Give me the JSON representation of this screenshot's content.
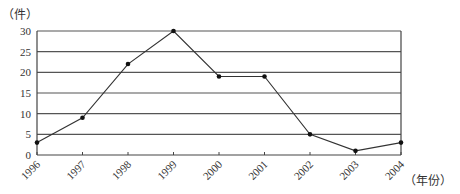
{
  "chart_data": {
    "type": "line",
    "title": "",
    "xlabel": "（年份）",
    "ylabel": "（件）",
    "categories": [
      "1996",
      "1997",
      "1998",
      "1999",
      "2000",
      "2001",
      "2002",
      "2003",
      "2004"
    ],
    "values": [
      3,
      9,
      22,
      30,
      19,
      19,
      5,
      1,
      3
    ],
    "y_ticks": [
      0,
      5,
      10,
      15,
      20,
      25,
      30
    ],
    "ylim": [
      0,
      30
    ],
    "grid": true,
    "legend": null,
    "marker": "dot",
    "line_color": "#333333"
  },
  "labels": {
    "y_unit": "（件）",
    "x_unit": "（年份）"
  }
}
